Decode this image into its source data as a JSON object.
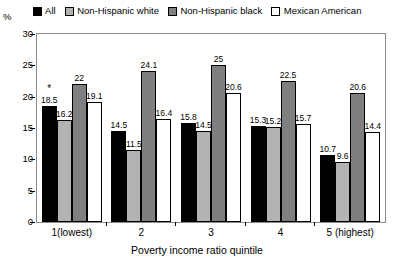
{
  "chart_data": {
    "type": "bar",
    "title": "",
    "xlabel": "Poverty income ratio quintile",
    "ylabel": "%",
    "ylim": [
      0,
      30
    ],
    "yticks": [
      0,
      5,
      10,
      15,
      20,
      25,
      30
    ],
    "ytick_labels": [
      "0",
      "5",
      "10",
      "15",
      "20",
      "25",
      "30"
    ],
    "grid": false,
    "legend_position": "top",
    "categories": [
      "1(lowest)",
      "2",
      "3",
      "4",
      "5 (highest)"
    ],
    "series": [
      {
        "name": "All",
        "color": "#000000",
        "values": [
          18.5,
          14.5,
          15.8,
          15.3,
          10.7
        ],
        "labels": [
          "18.5",
          "14.5",
          "15.8",
          "15.3",
          "10.7"
        ],
        "annotations": [
          "*",
          "",
          "",
          "",
          ""
        ]
      },
      {
        "name": "Non-Hispanic white",
        "color": "#b3b3b3",
        "values": [
          16.2,
          11.5,
          14.5,
          15.2,
          9.6
        ],
        "labels": [
          "16.2",
          "11.5",
          "14.5",
          "15.2",
          "9.6"
        ],
        "annotations": [
          "",
          "",
          "",
          "",
          ""
        ]
      },
      {
        "name": "Non-Hispanic black",
        "color": "#7f7f7f",
        "values": [
          22,
          24.1,
          25,
          22.5,
          20.6
        ],
        "labels": [
          "22",
          "24.1",
          "25",
          "22.5",
          "20.6"
        ],
        "annotations": [
          "",
          "",
          "",
          "",
          ""
        ]
      },
      {
        "name": "Mexican American",
        "color": "#ffffff",
        "values": [
          19.1,
          16.4,
          20.6,
          15.7,
          14.4
        ],
        "labels": [
          "19.1",
          "16.4",
          "20.6",
          "15.7",
          "14.4"
        ],
        "annotations": [
          "",
          "",
          "",
          "",
          ""
        ]
      }
    ]
  },
  "legend": {
    "items": [
      {
        "label": "All",
        "color": "#000000"
      },
      {
        "label": "Non-Hispanic white",
        "color": "#b3b3b3"
      },
      {
        "label": "Non-Hispanic black",
        "color": "#7f7f7f"
      },
      {
        "label": "Mexican American",
        "color": "#ffffff"
      }
    ]
  },
  "axes": {
    "y_unit": "%",
    "x_title": "Poverty income ratio quintile"
  }
}
